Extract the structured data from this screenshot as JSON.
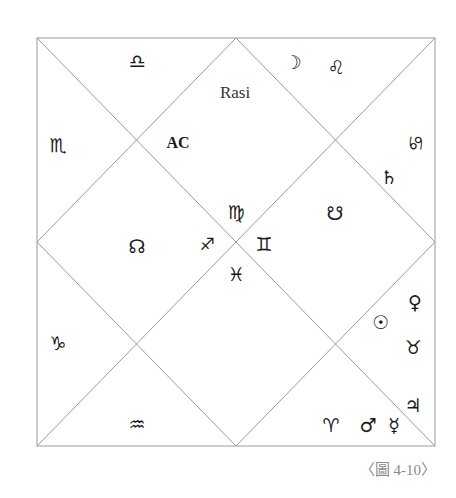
{
  "chart": {
    "title": "Rasi",
    "ascendant_label": "AC",
    "caption": "〈圖 4-10〉",
    "frame": {
      "left": 37,
      "top": 38,
      "right": 435,
      "bottom": 446
    },
    "line_color": "#9a9a9a"
  },
  "houses": [
    {
      "id": "h1",
      "sign": "virgo",
      "glyph": "♍",
      "x": 236,
      "y": 212,
      "planets": []
    },
    {
      "id": "h2",
      "sign": "libra",
      "glyph": "♎",
      "x": 137,
      "y": 61,
      "planets": []
    },
    {
      "id": "h3",
      "sign": "scorpio",
      "glyph": "♏",
      "x": 58,
      "y": 145,
      "planets": []
    },
    {
      "id": "h4",
      "sign": "sagittarius",
      "glyph": "♐",
      "x": 207,
      "y": 244,
      "planets": []
    },
    {
      "id": "h5",
      "sign": "capricorn",
      "glyph": "♑",
      "x": 58,
      "y": 343,
      "planets": []
    },
    {
      "id": "h6",
      "sign": "aquarius",
      "glyph": "♒",
      "x": 137,
      "y": 424,
      "planets": []
    },
    {
      "id": "h7",
      "sign": "pisces",
      "glyph": "♓",
      "x": 236,
      "y": 274,
      "planets": []
    },
    {
      "id": "h8",
      "sign": "aries",
      "glyph": "♈",
      "x": 331,
      "y": 425,
      "planets": [
        {
          "name": "mars",
          "glyph": "♂",
          "x": 368,
          "y": 425
        },
        {
          "name": "mercury",
          "glyph": "☿",
          "x": 394,
          "y": 425
        }
      ]
    },
    {
      "id": "h9",
      "sign": "taurus",
      "glyph": "♉",
      "x": 413,
      "y": 347,
      "planets": [
        {
          "name": "venus",
          "glyph": "♀",
          "x": 415,
          "y": 302
        },
        {
          "name": "sun",
          "glyph": "☉",
          "x": 381,
          "y": 322
        }
      ]
    },
    {
      "id": "h10",
      "sign": "gemini",
      "glyph": "♊",
      "x": 264,
      "y": 244,
      "planets": []
    },
    {
      "id": "h11",
      "sign": "cancer",
      "glyph": "♋",
      "x": 415,
      "y": 143,
      "planets": [
        {
          "name": "saturn",
          "glyph": "♄",
          "x": 389,
          "y": 177
        }
      ]
    },
    {
      "id": "h12",
      "sign": "leo",
      "glyph": "♌",
      "x": 336,
      "y": 67,
      "planets": [
        {
          "name": "moon",
          "glyph": "☽",
          "x": 293,
          "y": 62
        }
      ]
    }
  ],
  "nodes": [
    {
      "name": "rahu-north-node",
      "glyph": "☊",
      "x": 137,
      "y": 246
    },
    {
      "name": "ketu-south-node",
      "glyph": "☋",
      "x": 335,
      "y": 213
    }
  ],
  "extra_planets": [
    {
      "name": "jupiter",
      "glyph": "♃",
      "x": 413,
      "y": 405
    }
  ],
  "labels": {
    "rasi": {
      "x": 235,
      "y": 93
    },
    "ac": {
      "x": 178,
      "y": 143
    }
  }
}
